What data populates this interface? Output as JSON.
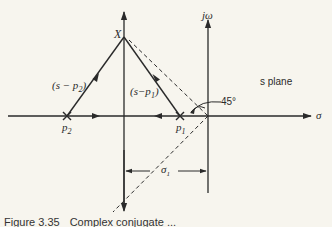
{
  "diagram": {
    "title": "s plane",
    "axes": {
      "horizontal_label": "σ",
      "vertical_label": "jω"
    },
    "points": {
      "test_point": "X",
      "pole_1": "p",
      "pole_1_sub": "1",
      "pole_2": "p",
      "pole_2_sub": "2"
    },
    "vectors": {
      "v2_label": "(s − p",
      "v2_sub": "2",
      "v2_close": ")",
      "v1_label": "(s−p",
      "v1_sub": "1",
      "v1_close": ")"
    },
    "angle_label": "45°",
    "dimension": {
      "label": "σ",
      "sub": "1"
    }
  },
  "caption": {
    "number": "Figure 3.35",
    "text": "Complex conjugate ..."
  }
}
